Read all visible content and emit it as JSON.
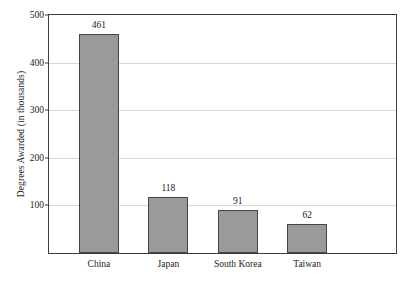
{
  "chart_data": {
    "type": "bar",
    "title": "",
    "subtitle": "",
    "xlabel": "",
    "ylabel": "Degrees Awarded (in thousands)",
    "categories": [
      "China",
      "Japan",
      "South Korea",
      "Taiwan"
    ],
    "values": [
      461,
      118,
      91,
      62
    ],
    "value_labels": [
      "461",
      "118",
      "91",
      "62"
    ],
    "ylim": [
      0,
      500
    ],
    "y_ticks": [
      100,
      200,
      300,
      400,
      500
    ],
    "y_tick_labels": [
      "100",
      "200",
      "300",
      "400",
      "500"
    ],
    "grid": true,
    "grid_axis": "y",
    "legend": false,
    "legend_position": "none",
    "bar_color": "#9a9a9a",
    "bar_border_color": "#444444",
    "gridline_color": "#d8d8d8",
    "axis_color": "#3d3d3d",
    "background_color": "#ffffff",
    "text_color": "#1a1a1a"
  }
}
